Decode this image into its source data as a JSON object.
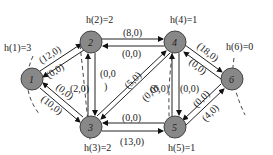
{
  "diagram": {
    "type": "flow-network",
    "node_color": "#888888",
    "nodes": [
      {
        "id": "1",
        "label": "1",
        "x": 32,
        "y": 79,
        "h_label": "h(1)=3",
        "hx": 4,
        "hy": 51
      },
      {
        "id": "2",
        "label": "2",
        "x": 91,
        "y": 42,
        "h_label": "h(2)=2",
        "hx": 86,
        "hy": 23
      },
      {
        "id": "3",
        "label": "3",
        "x": 91,
        "y": 127,
        "h_label": "h(3)=2",
        "hx": 84,
        "hy": 151
      },
      {
        "id": "4",
        "label": "4",
        "x": 175,
        "y": 42,
        "h_label": "h(4)=1",
        "hx": 170,
        "hy": 23
      },
      {
        "id": "5",
        "label": "5",
        "x": 175,
        "y": 127,
        "h_label": "h(5)=1",
        "hx": 168,
        "hy": 151
      },
      {
        "id": "6",
        "label": "6",
        "x": 232,
        "y": 79,
        "h_label": "h(6)=0",
        "hx": 226,
        "hy": 50
      }
    ],
    "edges": [
      {
        "from": "1",
        "to": "2",
        "label": "(12,0)"
      },
      {
        "from": "2",
        "to": "1",
        "label": "(0,0)"
      },
      {
        "from": "1",
        "to": "3",
        "label": "(10,0)"
      },
      {
        "from": "3",
        "to": "1",
        "label": "(0,0)"
      },
      {
        "from": "2",
        "to": "4",
        "label": "(8,0)"
      },
      {
        "from": "4",
        "to": "2",
        "label": "(0,0)"
      },
      {
        "from": "3",
        "to": "2",
        "label": "(2,0)"
      },
      {
        "from": "2",
        "to": "3",
        "label": "(0,0)"
      },
      {
        "from": "3",
        "to": "4",
        "label": "(0,0)"
      },
      {
        "from": "4",
        "to": "3",
        "label": "(5,0)"
      },
      {
        "from": "3",
        "to": "5",
        "label": "(13,0)"
      },
      {
        "from": "5",
        "to": "3",
        "label": "(0,0)"
      },
      {
        "from": "5",
        "to": "4",
        "label": "(6,0)"
      },
      {
        "from": "4",
        "to": "5",
        "label": "(0,0)"
      },
      {
        "from": "4",
        "to": "6",
        "label": "(18,0)"
      },
      {
        "from": "6",
        "to": "4",
        "label": "(0,0)"
      },
      {
        "from": "5",
        "to": "6",
        "label": "(4,0)"
      },
      {
        "from": "6",
        "to": "5",
        "label": "(0,0)"
      }
    ]
  }
}
